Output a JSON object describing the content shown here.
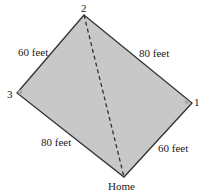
{
  "diagram": {
    "type": "baseball-diamond",
    "fill_color": "#c8c8c8",
    "edge_color": "#333333",
    "vertices": {
      "base2": {
        "label": "2",
        "x": 84,
        "y": 15
      },
      "base3": {
        "label": "3",
        "x": 17,
        "y": 93
      },
      "base1": {
        "label": "1",
        "x": 192,
        "y": 103
      },
      "home": {
        "label": "Home",
        "x": 124,
        "y": 177
      }
    },
    "edges": [
      {
        "from": "base3",
        "to": "base2",
        "label": "60 feet"
      },
      {
        "from": "base2",
        "to": "base1",
        "label": "80 feet"
      },
      {
        "from": "base3",
        "to": "home",
        "label": "80 feet"
      },
      {
        "from": "home",
        "to": "base1",
        "label": "60 feet"
      }
    ],
    "diagonal": {
      "from": "base2",
      "to": "home",
      "style": "dashed"
    }
  }
}
